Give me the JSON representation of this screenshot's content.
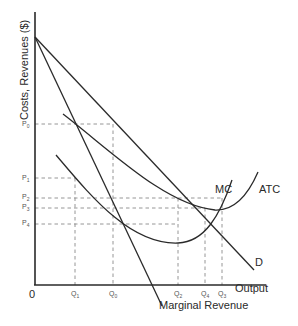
{
  "diagram": {
    "y_axis_label": "Costs, Revenues ($)",
    "x_axis_label": "Output",
    "origin_label": "0",
    "curves": {
      "demand": "D",
      "marginal_revenue": "Marginal Revenue",
      "marginal_cost": "MC",
      "average_total_cost": "ATC"
    },
    "price_ticks": [
      {
        "base": "P",
        "sub": "0"
      },
      {
        "base": "P",
        "sub": "1"
      },
      {
        "base": "P",
        "sub": "2"
      },
      {
        "base": "P",
        "sub": "3"
      },
      {
        "base": "P",
        "sub": "4"
      }
    ],
    "quantity_ticks": [
      {
        "base": "Q",
        "sub": "1"
      },
      {
        "base": "Q",
        "sub": "0"
      },
      {
        "base": "Q",
        "sub": "2"
      },
      {
        "base": "Q",
        "sub": "4"
      },
      {
        "base": "Q",
        "sub": "3"
      }
    ]
  }
}
